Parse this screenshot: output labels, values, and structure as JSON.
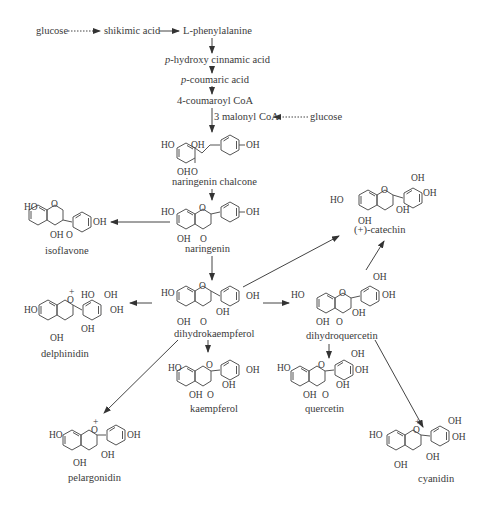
{
  "diagram": {
    "precursors": {
      "glucose_1": "glucose",
      "shikimic_acid": "shikimic acid",
      "phenylalanine": "L-phenylalanine",
      "hydroxy_cinnamic_prefix": "p",
      "hydroxy_cinnamic": "-hydroxy cinnamic acid",
      "coumaric_prefix": "p",
      "coumaric": "-coumaric acid",
      "coumaroyl_coa": "4-coumaroyl CoA",
      "malonyl_coa": "3 malonyl CoA",
      "glucose_2": "glucose"
    },
    "compounds": {
      "naringenin_chalcone": "naringenin chalcone",
      "naringenin": "naringenin",
      "isoflavone": "isoflavone",
      "catechin": "(+)-catechin",
      "delphinidin": "delphinidin",
      "dihydrokaempferol": "dihydrokaempferol",
      "dihydroquercetin": "dihydroquercetin",
      "kaempferol": "kaempferol",
      "quercetin": "quercetin",
      "pelargonidin": "pelargonidin",
      "cyanidin": "cyanidin"
    },
    "atoms": {
      "HO": "HO",
      "OH": "OH",
      "O": "O",
      "plus": "+"
    },
    "edges": [
      {
        "from": "glucose",
        "to": "shikimic acid",
        "style": "dotted"
      },
      {
        "from": "shikimic acid",
        "to": "L-phenylalanine",
        "style": "solid"
      },
      {
        "from": "L-phenylalanine",
        "to": "p-hydroxy cinnamic acid",
        "style": "solid"
      },
      {
        "from": "p-hydroxy cinnamic acid",
        "to": "p-coumaric acid",
        "style": "solid"
      },
      {
        "from": "p-coumaric acid",
        "to": "4-coumaroyl CoA",
        "style": "solid"
      },
      {
        "from": "glucose",
        "to": "3 malonyl CoA",
        "style": "dotted"
      },
      {
        "from": "4-coumaroyl CoA",
        "to": "naringenin chalcone",
        "style": "solid"
      },
      {
        "from": "naringenin chalcone",
        "to": "naringenin",
        "style": "solid"
      },
      {
        "from": "naringenin",
        "to": "isoflavone",
        "style": "solid"
      },
      {
        "from": "naringenin",
        "to": "dihydrokaempferol",
        "style": "solid"
      },
      {
        "from": "dihydrokaempferol",
        "to": "(+)-catechin",
        "style": "solid"
      },
      {
        "from": "dihydroquercetin",
        "to": "(+)-catechin",
        "style": "solid"
      },
      {
        "from": "dihydrokaempferol",
        "to": "delphinidin",
        "style": "solid"
      },
      {
        "from": "dihydrokaempferol",
        "to": "dihydroquercetin",
        "style": "solid"
      },
      {
        "from": "dihydrokaempferol",
        "to": "kaempferol",
        "style": "solid"
      },
      {
        "from": "dihydrokaempferol",
        "to": "pelargonidin",
        "style": "solid"
      },
      {
        "from": "dihydroquercetin",
        "to": "quercetin",
        "style": "solid"
      },
      {
        "from": "dihydroquercetin",
        "to": "cyanidin",
        "style": "solid"
      }
    ]
  }
}
